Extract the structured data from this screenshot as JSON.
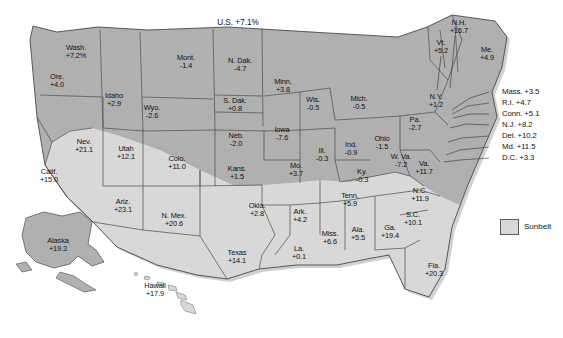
{
  "figure": {
    "us_total_label": "U.S. +7.1%",
    "legend": {
      "swatch_name": "sunbelt-swatch",
      "label": "Sunbelt"
    },
    "colors": {
      "non_sunbelt_fill": "#b0b0b0",
      "sunbelt_fill": "#d8d8d8",
      "border": "#4a4a4a",
      "shadow": "#c9c9c9",
      "text": "#111111",
      "background": "#ffffff"
    }
  },
  "chart_data": {
    "type": "map",
    "title": "U.S. +7.1%",
    "unit": "percent change",
    "legend": [
      "Sunbelt"
    ],
    "national_value": 7.1,
    "states": [
      {
        "name": "Wash.",
        "value": "+7.2%",
        "num": 7.2,
        "sunbelt": false,
        "x": 76,
        "y": 52
      },
      {
        "name": "Ore.",
        "value": "+4.0",
        "num": 4.0,
        "sunbelt": false,
        "x": 57,
        "y": 81
      },
      {
        "name": "Idaho",
        "value": "+2.9",
        "num": 2.9,
        "sunbelt": false,
        "x": 114,
        "y": 100
      },
      {
        "name": "Mont.",
        "value": "-1.4",
        "num": -1.4,
        "sunbelt": false,
        "x": 186,
        "y": 62
      },
      {
        "name": "Wyo.",
        "value": "-2.6",
        "num": -2.6,
        "sunbelt": false,
        "x": 152,
        "y": 112
      },
      {
        "name": "N. Dak.",
        "value": "-4.7",
        "num": -4.7,
        "sunbelt": false,
        "x": 240,
        "y": 65
      },
      {
        "name": "S. Dak.",
        "value": "+0.8",
        "num": 0.8,
        "sunbelt": false,
        "x": 235,
        "y": 105
      },
      {
        "name": "Neb.",
        "value": "-2.0",
        "num": -2.0,
        "sunbelt": false,
        "x": 236,
        "y": 140
      },
      {
        "name": "Minn.",
        "value": "+3.8",
        "num": 3.8,
        "sunbelt": false,
        "x": 283,
        "y": 86
      },
      {
        "name": "Wis.",
        "value": "-0.5",
        "num": -0.5,
        "sunbelt": false,
        "x": 313,
        "y": 104
      },
      {
        "name": "Iowa",
        "value": "-7.6",
        "num": -7.6,
        "sunbelt": false,
        "x": 282,
        "y": 134
      },
      {
        "name": "Mich.",
        "value": "-0.5",
        "num": -0.5,
        "sunbelt": false,
        "x": 359,
        "y": 103
      },
      {
        "name": "Nev.",
        "value": "+21.1",
        "num": 21.1,
        "sunbelt": true,
        "x": 84,
        "y": 146
      },
      {
        "name": "Utah",
        "value": "+12.1",
        "num": 12.1,
        "sunbelt": false,
        "x": 126,
        "y": 153
      },
      {
        "name": "Colo.",
        "value": "+11.0",
        "num": 11.0,
        "sunbelt": false,
        "x": 177,
        "y": 163
      },
      {
        "name": "Kans.",
        "value": "+1.5",
        "num": 1.5,
        "sunbelt": false,
        "x": 237,
        "y": 173
      },
      {
        "name": "Mo.",
        "value": "+3.7",
        "num": 3.7,
        "sunbelt": false,
        "x": 296,
        "y": 170
      },
      {
        "name": "Ill.",
        "value": "-0.3",
        "num": -0.3,
        "sunbelt": false,
        "x": 322,
        "y": 155
      },
      {
        "name": "Ind.",
        "value": "-0.9",
        "num": -0.9,
        "sunbelt": false,
        "x": 351,
        "y": 149
      },
      {
        "name": "Ohio",
        "value": "-1.5",
        "num": -1.5,
        "sunbelt": false,
        "x": 382,
        "y": 143
      },
      {
        "name": "Calif.",
        "value": "+15.0",
        "num": 15.0,
        "sunbelt": true,
        "x": 49,
        "y": 176
      },
      {
        "name": "Ariz.",
        "value": "+23.1",
        "num": 23.1,
        "sunbelt": true,
        "x": 123,
        "y": 206
      },
      {
        "name": "N. Mex.",
        "value": "+20.6",
        "num": 20.6,
        "sunbelt": true,
        "x": 174,
        "y": 220
      },
      {
        "name": "Okla.",
        "value": "+2.8",
        "num": 2.8,
        "sunbelt": true,
        "x": 257,
        "y": 210
      },
      {
        "name": "Texas",
        "value": "+14.1",
        "num": 14.1,
        "sunbelt": true,
        "x": 237,
        "y": 257
      },
      {
        "name": "Ark.",
        "value": "+4.2",
        "num": 4.2,
        "sunbelt": true,
        "x": 300,
        "y": 216
      },
      {
        "name": "La.",
        "value": "+0.1",
        "num": 0.1,
        "sunbelt": true,
        "x": 299,
        "y": 253
      },
      {
        "name": "Miss.",
        "value": "+6.6",
        "num": 6.6,
        "sunbelt": true,
        "x": 330,
        "y": 238
      },
      {
        "name": "Ala.",
        "value": "+5.5",
        "num": 5.5,
        "sunbelt": true,
        "x": 358,
        "y": 234
      },
      {
        "name": "Ga.",
        "value": "+19.4",
        "num": 19.4,
        "sunbelt": true,
        "x": 390,
        "y": 232
      },
      {
        "name": "Tenn.",
        "value": "+5.9",
        "num": 5.9,
        "sunbelt": true,
        "x": 350,
        "y": 200
      },
      {
        "name": "Ky.",
        "value": "-0.3",
        "num": -0.3,
        "sunbelt": false,
        "x": 362,
        "y": 176
      },
      {
        "name": "W. Va.",
        "value": "-7.2",
        "num": -7.2,
        "sunbelt": false,
        "x": 401,
        "y": 161
      },
      {
        "name": "Va.",
        "value": "+11.7",
        "num": 11.7,
        "sunbelt": false,
        "x": 424,
        "y": 168
      },
      {
        "name": "N.C.",
        "value": "+11.9",
        "num": 11.9,
        "sunbelt": true,
        "x": 420,
        "y": 195
      },
      {
        "name": "S.C.",
        "value": "+10.1",
        "num": 10.1,
        "sunbelt": true,
        "x": 413,
        "y": 219
      },
      {
        "name": "Fla.",
        "value": "+20.3",
        "num": 20.3,
        "sunbelt": true,
        "x": 434,
        "y": 270
      },
      {
        "name": "Pa.",
        "value": "-2.7",
        "num": -2.7,
        "sunbelt": false,
        "x": 415,
        "y": 124
      },
      {
        "name": "N.Y.",
        "value": "+1.2",
        "num": 1.2,
        "sunbelt": false,
        "x": 436,
        "y": 101
      },
      {
        "name": "Vt.",
        "value": "+5.2",
        "num": 5.2,
        "sunbelt": false,
        "x": 441,
        "y": 47
      },
      {
        "name": "N.H.",
        "value": "+16.7",
        "num": 16.7,
        "sunbelt": false,
        "x": 459,
        "y": 27
      },
      {
        "name": "Me.",
        "value": "+4.9",
        "num": 4.9,
        "sunbelt": false,
        "x": 487,
        "y": 54
      },
      {
        "name": "Alaska",
        "value": "+19.3",
        "num": 19.3,
        "sunbelt": false,
        "x": 58,
        "y": 245
      },
      {
        "name": "Hawaii",
        "value": "+17.9",
        "num": 17.9,
        "sunbelt": true,
        "x": 155,
        "y": 290
      }
    ],
    "callouts": [
      {
        "label": "Mass. +3.5",
        "num": 3.5,
        "x": 502,
        "y": 92
      },
      {
        "label": "R.I. +4.7",
        "num": 4.7,
        "x": 502,
        "y": 103
      },
      {
        "label": "Conn. +5.1",
        "num": 5.1,
        "x": 502,
        "y": 114
      },
      {
        "label": "N.J. +8.2",
        "num": 8.2,
        "x": 502,
        "y": 125
      },
      {
        "label": "Del. +10.2",
        "num": 10.2,
        "x": 502,
        "y": 136
      },
      {
        "label": "Md. +11.5",
        "num": 11.5,
        "x": 502,
        "y": 147
      },
      {
        "label": "D.C. +3.3",
        "num": 3.3,
        "x": 502,
        "y": 158
      }
    ]
  }
}
